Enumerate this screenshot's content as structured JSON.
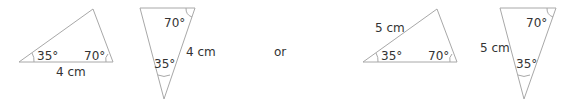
{
  "figure": {
    "triangle1": {
      "angle_left": "35°",
      "angle_right": "70°",
      "side": "4 cm"
    },
    "triangle2": {
      "angle_top": "70°",
      "angle_bottom": "35°",
      "side": "4 cm"
    },
    "connector": "or",
    "triangle3": {
      "angle_left": "35°",
      "angle_right": "70°",
      "side": "5 cm"
    },
    "triangle4": {
      "angle_top": "70°",
      "angle_bottom": "35°",
      "side": "5 cm"
    },
    "line_color": "#a8a8a8"
  }
}
